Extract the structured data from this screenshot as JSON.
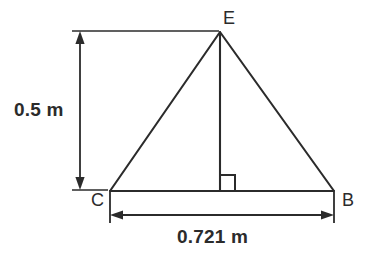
{
  "diagram": {
    "kind": "triangle-with-altitude",
    "stroke_color": "#2b2b2b",
    "background_color": "#ffffff",
    "vertices": [
      {
        "name": "E",
        "label": "E",
        "x": 220,
        "y": 32,
        "role": "apex"
      },
      {
        "name": "C",
        "label": "C",
        "x": 110,
        "y": 191,
        "role": "base-left"
      },
      {
        "name": "B",
        "label": "B",
        "x": 334,
        "y": 191,
        "role": "base-right"
      }
    ],
    "altitude": {
      "from": "E",
      "foot_x": 220,
      "foot_y": 191,
      "right_angle_marker": true
    },
    "dimensions": {
      "height": {
        "label": "0.5 m",
        "value": 0.5,
        "unit": "m",
        "orientation": "vertical",
        "measures": "E to base CB"
      },
      "base": {
        "label": "0.721 m",
        "value": 0.721,
        "unit": "m",
        "orientation": "horizontal",
        "measures": "C to B"
      }
    }
  }
}
